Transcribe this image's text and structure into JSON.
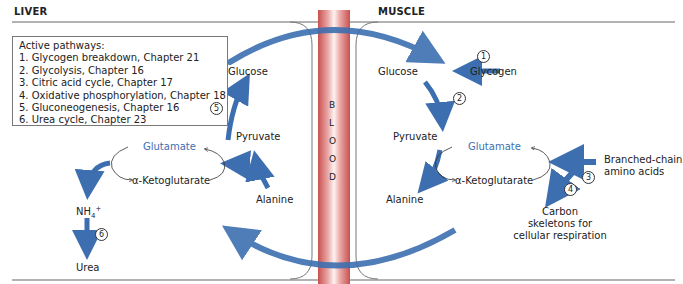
{
  "headers": {
    "liver": "LIVER",
    "muscle": "MUSCLE"
  },
  "legend": {
    "title": "Active pathways:",
    "items": [
      "1.  Glycogen breakdown, Chapter 21",
      "2.  Glycolysis, Chapter 16",
      "3.  Citric acid cycle, Chapter 17",
      "4.  Oxidative phosphorylation, Chapter 18",
      "5.  Gluconeogenesis, Chapter 16",
      "6.  Urea cycle, Chapter 23"
    ]
  },
  "blood": {
    "letters": [
      "B",
      "L",
      "O",
      "O",
      "D"
    ]
  },
  "liver": {
    "glucose": "Glucose",
    "pyruvate": "Pyruvate",
    "alanine": "Alanine",
    "glutamate": "Glutamate",
    "ketoglutarate": "α-Ketoglutarate",
    "ammonium": "NH",
    "ammonium_sub": "4",
    "ammonium_sup": "+",
    "urea": "Urea",
    "step5": "5",
    "step6": "6"
  },
  "muscle": {
    "glucose": "Glucose",
    "glycogen": "Glycogen",
    "pyruvate": "Pyruvate",
    "alanine": "Alanine",
    "glutamate": "Glutamate",
    "ketoglutarate": "α-Ketoglutarate",
    "bcaa_line1": "Branched-chain",
    "bcaa_line2": "amino acids",
    "carbon_line1": "Carbon",
    "carbon_line2": "skeletons for",
    "carbon_line3": "cellular respiration",
    "step1": "1",
    "step2": "2",
    "step3": "3",
    "step4": "4"
  },
  "colors": {
    "arrow": "#3d6fb0",
    "blood": "#c9504f",
    "text_blue": "#3d6fb0"
  }
}
